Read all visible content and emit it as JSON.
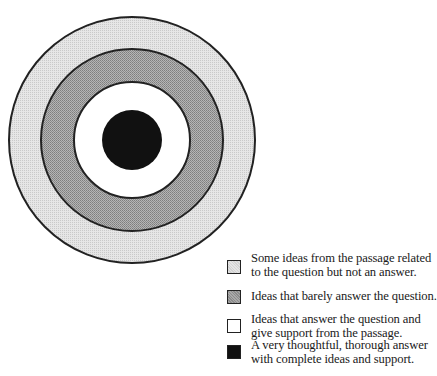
{
  "diagram": {
    "type": "concentric-target",
    "center": {
      "x": 132,
      "y": 140
    },
    "rings": [
      {
        "name": "outer",
        "radius": 123,
        "fill": "#e4e4e4",
        "pattern": "light-stipple"
      },
      {
        "name": "middle",
        "radius": 91,
        "fill": "#a9a9a9",
        "pattern": "medium-stipple"
      },
      {
        "name": "inner",
        "radius": 58,
        "fill": "#ffffff",
        "pattern": "none"
      },
      {
        "name": "bullseye",
        "radius": 30,
        "fill": "#111111",
        "pattern": "solid"
      }
    ],
    "stroke_color": "#222222"
  },
  "legend": {
    "items": [
      {
        "swatch": "light",
        "color": "#e4e4e4",
        "line1": "Some ideas from the passage related",
        "line2": "to the question but not an answer."
      },
      {
        "swatch": "medium",
        "color": "#a9a9a9",
        "line1": "Ideas that barely answer the question.",
        "line2": ""
      },
      {
        "swatch": "white",
        "color": "#ffffff",
        "line1": "Ideas that answer the question and",
        "line2": "give support from the passage."
      },
      {
        "swatch": "black",
        "color": "#111111",
        "line1": "A very thoughtful, thorough answer",
        "line2": "with complete ideas and support."
      }
    ]
  }
}
